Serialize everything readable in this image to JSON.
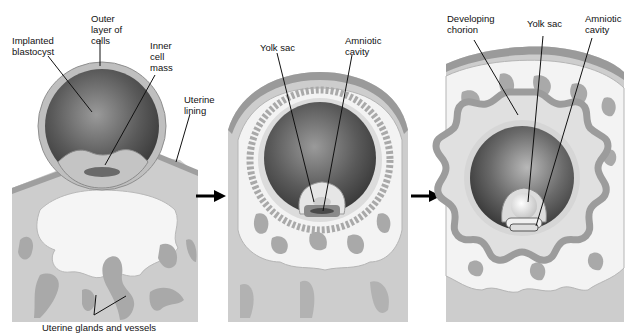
{
  "diagram": {
    "panels": [
      {
        "id": "stage-1",
        "labels": {
          "implanted_blastocyst": "Implanted\nblastocyst",
          "outer_layer": "Outer\nlayer of\ncells",
          "inner_cell_mass": "Inner\ncell\nmass",
          "uterine_lining": "Uterine\nlining",
          "uterine_glands": "Uterine glands and vessels"
        }
      },
      {
        "id": "stage-2",
        "labels": {
          "yolk_sac": "Yolk sac",
          "amniotic_cavity": "Amniotic\ncavity"
        }
      },
      {
        "id": "stage-3",
        "labels": {
          "developing_chorion": "Developing\nchorion",
          "yolk_sac": "Yolk sac",
          "amniotic_cavity": "Amniotic\ncavity"
        }
      }
    ],
    "arrows": [
      "stage-1-to-2",
      "stage-2-to-3"
    ],
    "colors": {
      "tissue_gray": "#c9c9c9",
      "lining_dark": "#9a9a9a",
      "vessel_gray": "#a8a8a8",
      "decidua_white": "#f4f4f4",
      "cavity_dark": "#4a4a4a",
      "chorion": "#a9a9a9"
    }
  }
}
